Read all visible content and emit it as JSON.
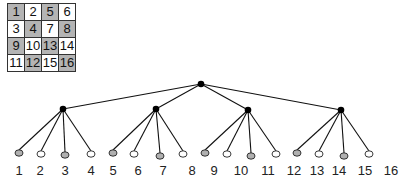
{
  "grid": {
    "rows": [
      [
        {
          "label": "1",
          "shade": "gray"
        },
        {
          "label": "2",
          "shade": "white"
        },
        {
          "label": "5",
          "shade": "gray"
        },
        {
          "label": "6",
          "shade": "white"
        }
      ],
      [
        {
          "label": "3",
          "shade": "white"
        },
        {
          "label": "4",
          "shade": "gray"
        },
        {
          "label": "7",
          "shade": "white"
        },
        {
          "label": "8",
          "shade": "gray"
        }
      ],
      [
        {
          "label": "9",
          "shade": "gray"
        },
        {
          "label": "10",
          "shade": "white"
        },
        {
          "label": "13",
          "shade": "gray"
        },
        {
          "label": "14",
          "shade": "white"
        }
      ],
      [
        {
          "label": "11",
          "shade": "white"
        },
        {
          "label": "12",
          "shade": "gray"
        },
        {
          "label": "15",
          "shade": "white"
        },
        {
          "label": "16",
          "shade": "gray"
        }
      ]
    ]
  },
  "tree": {
    "colors": {
      "edge": "#111111",
      "internal": "#000000",
      "leaf_gray": "#b0b0b0",
      "leaf_white": "#ffffff"
    },
    "root": {
      "x": 201,
      "y": 84
    },
    "children": [
      {
        "x": 63,
        "y": 109,
        "leaves": [
          {
            "x": 19,
            "y": 153,
            "shade": "gray"
          },
          {
            "x": 41,
            "y": 154,
            "shade": "white"
          },
          {
            "x": 65,
            "y": 155,
            "shade": "gray"
          },
          {
            "x": 91,
            "y": 154,
            "shade": "white"
          }
        ]
      },
      {
        "x": 156,
        "y": 109,
        "leaves": [
          {
            "x": 113,
            "y": 153,
            "shade": "gray"
          },
          {
            "x": 134,
            "y": 154,
            "shade": "white"
          },
          {
            "x": 160,
            "y": 156,
            "shade": "gray"
          },
          {
            "x": 183,
            "y": 154,
            "shade": "white"
          }
        ]
      },
      {
        "x": 248,
        "y": 110,
        "leaves": [
          {
            "x": 205,
            "y": 153,
            "shade": "gray"
          },
          {
            "x": 227,
            "y": 154,
            "shade": "white"
          },
          {
            "x": 251,
            "y": 156,
            "shade": "gray"
          },
          {
            "x": 276,
            "y": 154,
            "shade": "white"
          }
        ]
      },
      {
        "x": 341,
        "y": 110,
        "leaves": [
          {
            "x": 297,
            "y": 153,
            "shade": "gray"
          },
          {
            "x": 319,
            "y": 154,
            "shade": "white"
          },
          {
            "x": 344,
            "y": 156,
            "shade": "gray"
          },
          {
            "x": 369,
            "y": 154,
            "shade": "white"
          }
        ]
      }
    ]
  },
  "labels": [
    {
      "text": "1",
      "x": 19
    },
    {
      "text": "2",
      "x": 40
    },
    {
      "text": "3",
      "x": 65
    },
    {
      "text": "4",
      "x": 91
    },
    {
      "text": "5",
      "x": 113
    },
    {
      "text": "6",
      "x": 138
    },
    {
      "text": "7",
      "x": 163
    },
    {
      "text": "8",
      "x": 192
    },
    {
      "text": "9",
      "x": 214
    },
    {
      "text": "10",
      "x": 241
    },
    {
      "text": "11",
      "x": 268
    },
    {
      "text": "12",
      "x": 294
    },
    {
      "text": "13",
      "x": 317
    },
    {
      "text": "14",
      "x": 339
    },
    {
      "text": "15",
      "x": 365
    },
    {
      "text": "16",
      "x": 391
    }
  ],
  "labels_y": 175
}
